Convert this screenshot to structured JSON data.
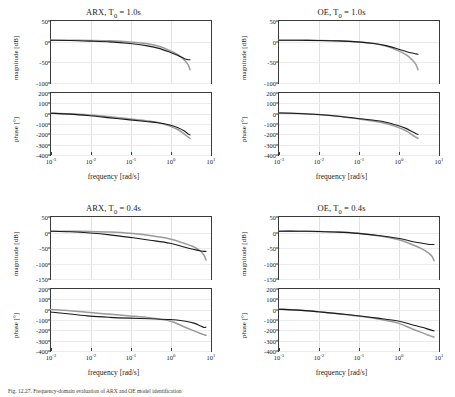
{
  "figure": {
    "caption": "Fig. 12.27. Frequency-domain evaluation of ARX and OE model identification",
    "colors": {
      "reference": "#9a9a9a",
      "estimate": "#1a1a1a",
      "axis": "#3a3a3a",
      "grid": "#e2e2e2"
    }
  },
  "panels": [
    {
      "id": "arx-1",
      "title_main": "ARX, T",
      "title_sub": "0",
      "title_tail": " = 1.0s",
      "title_full": "ARX, T0 = 1.0s",
      "magnitude": {
        "ylabel": "magnitude  [dB]",
        "yticks": [
          "50",
          "0",
          "-50",
          "-100"
        ],
        "ylim": [
          -100,
          50
        ]
      },
      "phase": {
        "ylabel": "phase  [°]",
        "yticks": [
          "200",
          "100",
          "0",
          "-100",
          "-200",
          "-300",
          "-400"
        ],
        "ylim": [
          -400,
          200
        ]
      },
      "xlabel": "frequency  [rad/s]",
      "xticks": [
        "-3",
        "-2",
        "-1",
        "0",
        "1"
      ],
      "xlim": [
        -3,
        1
      ]
    },
    {
      "id": "oe-1",
      "title_main": "OE, T",
      "title_sub": "0",
      "title_tail": " = 1.0s",
      "title_full": "OE, T0 = 1.0s",
      "magnitude": {
        "ylabel": "magnitude  [dB]",
        "yticks": [
          "50",
          "0",
          "-50",
          "-100"
        ],
        "ylim": [
          -100,
          50
        ]
      },
      "phase": {
        "ylabel": "phase  [°]",
        "yticks": [
          "200",
          "100",
          "0",
          "-100",
          "-200",
          "-300",
          "-400"
        ],
        "ylim": [
          -400,
          200
        ]
      },
      "xlabel": "frequency  [rad/s]",
      "xticks": [
        "-3",
        "-2",
        "-1",
        "0",
        "1"
      ],
      "xlim": [
        -3,
        1
      ]
    },
    {
      "id": "arx-04",
      "title_main": "ARX, T",
      "title_sub": "0",
      "title_tail": " = 0.4s",
      "title_full": "ARX, T0 = 0.4s",
      "magnitude": {
        "ylabel": "magnitude  [dB]",
        "yticks": [
          "50",
          "0",
          "-50",
          "-100",
          "-150"
        ],
        "ylim": [
          -150,
          50
        ]
      },
      "phase": {
        "ylabel": "phase  [°]",
        "yticks": [
          "200",
          "100",
          "0",
          "-100",
          "-200",
          "-300",
          "-400"
        ],
        "ylim": [
          -400,
          200
        ]
      },
      "xlabel": "frequency  [rad/s]",
      "xticks": [
        "-3",
        "-2",
        "-1",
        "0",
        "1"
      ],
      "xlim": [
        -3,
        1
      ]
    },
    {
      "id": "oe-04",
      "title_main": "OE, T",
      "title_sub": "0",
      "title_tail": " = 0.4s",
      "title_full": "OE, T0 = 0.4s",
      "magnitude": {
        "ylabel": "magnitude  [dB]",
        "yticks": [
          "50",
          "0",
          "-50",
          "-100",
          "-150"
        ],
        "ylim": [
          -150,
          50
        ]
      },
      "phase": {
        "ylabel": "phase  [°]",
        "yticks": [
          "200",
          "100",
          "0",
          "-100",
          "-200",
          "-300",
          "-400"
        ],
        "ylim": [
          -400,
          200
        ]
      },
      "xlabel": "frequency  [rad/s]",
      "xticks": [
        "-3",
        "-2",
        "-1",
        "0",
        "1"
      ],
      "xlim": [
        -3,
        1
      ]
    }
  ],
  "chart_data": {
    "type": "line",
    "xlabel": "frequency  [rad/s]",
    "xscale": "log",
    "legend": [
      "reference (gray)",
      "estimate (black)"
    ],
    "grid": true,
    "charts": [
      {
        "panel": "ARX, T0 = 1.0s",
        "subplot": "magnitude",
        "ylabel": "magnitude  [dB]",
        "ylim": [
          -100,
          50
        ],
        "xlim_decades": [
          -3,
          1
        ],
        "x_decades": [
          -3.0,
          -2.5,
          -2.0,
          -1.5,
          -1.0,
          -0.6,
          -0.3,
          0.0,
          0.2,
          0.35,
          0.45,
          0.5
        ],
        "series": [
          {
            "name": "reference",
            "color": "#9a9a9a",
            "values": [
              1,
              1,
              0.5,
              -0.5,
              -3,
              -7,
              -13,
              -24,
              -34,
              -46,
              -58,
              -70
            ]
          },
          {
            "name": "estimate",
            "color": "#1a1a1a",
            "values": [
              1,
              0.5,
              -1,
              -3,
              -7,
              -12,
              -18,
              -28,
              -36,
              -43,
              -46,
              -46
            ]
          }
        ]
      },
      {
        "panel": "ARX, T0 = 1.0s",
        "subplot": "phase",
        "ylabel": "phase  [°]",
        "ylim": [
          -400,
          200
        ],
        "xlim_decades": [
          -3,
          1
        ],
        "x_decades": [
          -3.0,
          -2.5,
          -2.0,
          -1.5,
          -1.0,
          -0.6,
          -0.3,
          0.0,
          0.2,
          0.35,
          0.45,
          0.5
        ],
        "series": [
          {
            "name": "reference",
            "color": "#9a9a9a",
            "values": [
              -4,
              -10,
              -22,
              -40,
              -62,
              -78,
              -95,
              -130,
              -165,
              -205,
              -235,
              -250
            ]
          },
          {
            "name": "estimate",
            "color": "#1a1a1a",
            "values": [
              -5,
              -14,
              -30,
              -50,
              -70,
              -85,
              -97,
              -120,
              -145,
              -175,
              -205,
              -215
            ]
          }
        ]
      },
      {
        "panel": "OE, T0 = 1.0s",
        "subplot": "magnitude",
        "ylabel": "magnitude  [dB]",
        "ylim": [
          -100,
          50
        ],
        "xlim_decades": [
          -3,
          1
        ],
        "x_decades": [
          -3.0,
          -2.5,
          -2.0,
          -1.5,
          -1.0,
          -0.6,
          -0.3,
          0.0,
          0.2,
          0.35,
          0.45,
          0.5
        ],
        "series": [
          {
            "name": "reference",
            "color": "#9a9a9a",
            "values": [
              1,
              1,
              0.5,
              -0.5,
              -3,
              -7,
              -13,
              -24,
              -34,
              -46,
              -58,
              -70
            ]
          },
          {
            "name": "estimate",
            "color": "#1a1a1a",
            "values": [
              1,
              1,
              0.5,
              -0.5,
              -3,
              -7,
              -12,
              -20,
              -26,
              -30,
              -32,
              -33
            ]
          }
        ]
      },
      {
        "panel": "OE, T0 = 1.0s",
        "subplot": "phase",
        "ylabel": "phase  [°]",
        "ylim": [
          -400,
          200
        ],
        "xlim_decades": [
          -3,
          1
        ],
        "x_decades": [
          -3.0,
          -2.5,
          -2.0,
          -1.5,
          -1.0,
          -0.6,
          -0.3,
          0.0,
          0.2,
          0.35,
          0.45,
          0.5
        ],
        "series": [
          {
            "name": "reference",
            "color": "#9a9a9a",
            "values": [
              -3,
              -8,
              -18,
              -35,
              -60,
              -82,
              -104,
              -142,
              -175,
              -212,
              -238,
              -248
            ]
          },
          {
            "name": "estimate",
            "color": "#1a1a1a",
            "values": [
              -3,
              -8,
              -18,
              -34,
              -56,
              -74,
              -92,
              -124,
              -152,
              -182,
              -203,
              -210
            ]
          }
        ]
      },
      {
        "panel": "ARX, T0 = 0.4s",
        "subplot": "magnitude",
        "ylabel": "magnitude  [dB]",
        "ylim": [
          -150,
          50
        ],
        "xlim_decades": [
          -3,
          1
        ],
        "x_decades": [
          -3.0,
          -2.5,
          -2.0,
          -1.5,
          -1.0,
          -0.5,
          0.0,
          0.35,
          0.6,
          0.75,
          0.85,
          0.9
        ],
        "series": [
          {
            "name": "reference",
            "color": "#9a9a9a",
            "values": [
              1,
              1,
              0,
              -2,
              -6,
              -13,
              -24,
              -38,
              -50,
              -62,
              -76,
              -92
            ]
          },
          {
            "name": "estimate",
            "color": "#1a1a1a",
            "values": [
              1,
              -1,
              -5,
              -11,
              -19,
              -28,
              -38,
              -50,
              -58,
              -62,
              -64,
              -64
            ]
          }
        ]
      },
      {
        "panel": "ARX, T0 = 0.4s",
        "subplot": "phase",
        "ylabel": "phase  [°]",
        "ylim": [
          -400,
          200
        ],
        "xlim_decades": [
          -3,
          1
        ],
        "x_decades": [
          -3.0,
          -2.5,
          -2.0,
          -1.5,
          -1.0,
          -0.5,
          0.0,
          0.35,
          0.6,
          0.75,
          0.85,
          0.9
        ],
        "series": [
          {
            "name": "reference",
            "color": "#9a9a9a",
            "values": [
              -8,
              -20,
              -38,
              -55,
              -70,
              -88,
              -120,
              -175,
              -215,
              -238,
              -252,
              -258
            ]
          },
          {
            "name": "estimate",
            "color": "#1a1a1a",
            "values": [
              -32,
              -52,
              -72,
              -84,
              -92,
              -98,
              -105,
              -120,
              -140,
              -165,
              -182,
              -178
            ]
          }
        ]
      },
      {
        "panel": "OE, T0 = 0.4s",
        "subplot": "magnitude",
        "ylabel": "magnitude  [dB]",
        "ylim": [
          -150,
          50
        ],
        "xlim_decades": [
          -3,
          1
        ],
        "x_decades": [
          -3.0,
          -2.5,
          -2.0,
          -1.5,
          -1.0,
          -0.5,
          0.0,
          0.35,
          0.6,
          0.75,
          0.85,
          0.9
        ],
        "series": [
          {
            "name": "reference",
            "color": "#9a9a9a",
            "values": [
              1,
              1,
              0,
              -2,
              -6,
              -14,
              -26,
              -42,
              -56,
              -68,
              -80,
              -94
            ]
          },
          {
            "name": "estimate",
            "color": "#1a1a1a",
            "values": [
              1,
              1,
              0,
              -2,
              -6,
              -13,
              -22,
              -32,
              -38,
              -41,
              -42,
              -42
            ]
          }
        ]
      },
      {
        "panel": "OE, T0 = 0.4s",
        "subplot": "phase",
        "ylabel": "phase  [°]",
        "ylim": [
          -400,
          200
        ],
        "xlim_decades": [
          -3,
          1
        ],
        "x_decades": [
          -3.0,
          -2.5,
          -2.0,
          -1.5,
          -1.0,
          -0.5,
          0.0,
          0.35,
          0.6,
          0.75,
          0.85,
          0.9
        ],
        "series": [
          {
            "name": "reference",
            "color": "#9a9a9a",
            "values": [
              -5,
              -14,
              -30,
              -50,
              -72,
              -100,
              -140,
              -195,
              -232,
              -255,
              -270,
              -275
            ]
          },
          {
            "name": "estimate",
            "color": "#1a1a1a",
            "values": [
              -5,
              -14,
              -30,
              -48,
              -68,
              -92,
              -120,
              -155,
              -180,
              -198,
              -210,
              -215
            ]
          }
        ]
      }
    ]
  }
}
